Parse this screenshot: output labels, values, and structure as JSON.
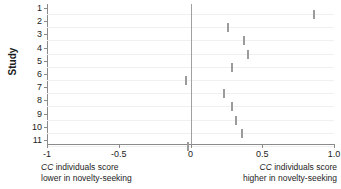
{
  "chart_data": {
    "type": "scatter",
    "title": "",
    "xlabel": "",
    "ylabel": "Study",
    "xlim": [
      -1.0,
      1.0
    ],
    "ylim": [
      11.5,
      0.5
    ],
    "grid": true,
    "legend": null,
    "x_ticks": [
      {
        "value": -1.0,
        "label": "-1"
      },
      {
        "value": -0.5,
        "label": "-0.5"
      },
      {
        "value": 0.0,
        "label": "0"
      },
      {
        "value": 0.5,
        "label": "0.5"
      },
      {
        "value": 1.0,
        "label": "1.0"
      }
    ],
    "y_ticks": [
      {
        "value": 1,
        "label": "1"
      },
      {
        "value": 2,
        "label": "2"
      },
      {
        "value": 3,
        "label": "3"
      },
      {
        "value": 4,
        "label": "4"
      },
      {
        "value": 5,
        "label": "5"
      },
      {
        "value": 6,
        "label": "6"
      },
      {
        "value": 7,
        "label": "7"
      },
      {
        "value": 8,
        "label": "8"
      },
      {
        "value": 9,
        "label": "9"
      },
      {
        "value": 10,
        "label": "10"
      },
      {
        "value": 11,
        "label": "11"
      }
    ],
    "reference_line": {
      "x": 0.0,
      "color": "#a0a0a0"
    },
    "categories": [
      "1",
      "2",
      "3",
      "4",
      "5",
      "6",
      "7",
      "8",
      "9",
      "10",
      "11"
    ],
    "values": [
      0.86,
      0.26,
      0.37,
      0.4,
      0.29,
      -0.03,
      0.23,
      0.29,
      0.32,
      0.36,
      -0.02
    ],
    "points": [
      {
        "study": "1",
        "effect": 0.86
      },
      {
        "study": "2",
        "effect": 0.26
      },
      {
        "study": "3",
        "effect": 0.37
      },
      {
        "study": "4",
        "effect": 0.4
      },
      {
        "study": "5",
        "effect": 0.29
      },
      {
        "study": "6",
        "effect": -0.03
      },
      {
        "study": "7",
        "effect": 0.23
      },
      {
        "study": "8",
        "effect": 0.29
      },
      {
        "study": "9",
        "effect": 0.32
      },
      {
        "study": "10",
        "effect": 0.36
      },
      {
        "study": "11",
        "effect": -0.02
      }
    ],
    "marker_color": "#9b9b9b",
    "annotations": {
      "left": [
        "CC individuals score",
        "lower in novelty-seeking"
      ],
      "right": [
        "CC individuals score",
        "higher in novelty-seeking"
      ]
    }
  },
  "axis": {
    "y_title": "Study"
  },
  "captions": {
    "left_gene": "CC",
    "left_line1_rest": " individuals score",
    "left_line2": "lower in novelty-seeking",
    "right_gene": "CC",
    "right_line1_rest": " individuals score",
    "right_line2": "higher in novelty-seeking"
  }
}
